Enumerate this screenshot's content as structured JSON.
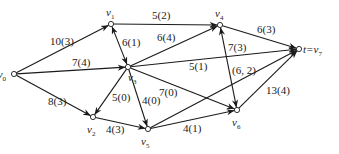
{
  "diagram": {
    "type": "flow-network",
    "nodes": [
      {
        "id": "v0",
        "label": "s=v",
        "sub": "0",
        "x": 14,
        "y": 74,
        "lx": -14,
        "ly": 78
      },
      {
        "id": "v1",
        "label": "v",
        "sub": "1",
        "x": 111,
        "y": 24,
        "lx": 106,
        "ly": 16
      },
      {
        "id": "v2",
        "label": "v",
        "sub": "2",
        "x": 93,
        "y": 117,
        "lx": 87,
        "ly": 133
      },
      {
        "id": "v3",
        "label": "v",
        "sub": "3",
        "x": 128,
        "y": 67,
        "lx": 128,
        "ly": 81
      },
      {
        "id": "v4",
        "label": "v",
        "sub": "4",
        "x": 220,
        "y": 25,
        "lx": 215,
        "ly": 17
      },
      {
        "id": "v5",
        "label": "v",
        "sub": "5",
        "x": 148,
        "y": 129,
        "lx": 141,
        "ly": 145
      },
      {
        "id": "v6",
        "label": "v",
        "sub": "6",
        "x": 237,
        "y": 110,
        "lx": 232,
        "ly": 126
      },
      {
        "id": "v7",
        "label": "t=v",
        "sub": "7",
        "x": 299,
        "y": 49,
        "lx": 303,
        "ly": 53
      }
    ],
    "edges": [
      {
        "from": "v0",
        "to": "v1",
        "label": "10(3)",
        "lx": 50,
        "ly": 45,
        "dir": "forward"
      },
      {
        "from": "v0",
        "to": "v3",
        "label": "7(4)",
        "lx": 72,
        "ly": 66,
        "dir": "forward"
      },
      {
        "from": "v0",
        "to": "v2",
        "label": "8(3)",
        "lx": 48,
        "ly": 105,
        "dir": "forward"
      },
      {
        "from": "v1",
        "to": "v4",
        "label": "5(2)",
        "lx": 152,
        "ly": 19,
        "dir": "forward"
      },
      {
        "from": "v1",
        "to": "v3",
        "label": "6(1)",
        "lx": 122,
        "ly": 46,
        "dir": "both"
      },
      {
        "from": "v3",
        "to": "v4",
        "label": "6(4)",
        "lx": 157,
        "ly": 41,
        "dir": "forward"
      },
      {
        "from": "v3",
        "to": "v7",
        "label": "5(1)",
        "lx": 189,
        "ly": 70,
        "dir": "forward"
      },
      {
        "from": "v3",
        "to": "v2",
        "label": "5(0)",
        "lx": 112,
        "ly": 101,
        "dir": "forward"
      },
      {
        "from": "v3",
        "to": "v5",
        "label": "4(0)",
        "lx": 142,
        "ly": 104,
        "dir": "forward"
      },
      {
        "from": "v3",
        "to": "v6",
        "label": "7(0)",
        "lx": 159,
        "ly": 96,
        "dir": "forward"
      },
      {
        "from": "v4",
        "to": "v7",
        "label": "6(3)",
        "lx": 257,
        "ly": 33,
        "dir": "forward"
      },
      {
        "from": "v6",
        "to": "v4",
        "label": "7(3)",
        "lx": 228,
        "ly": 51,
        "dir": "both"
      },
      {
        "from": "v5",
        "to": "v7",
        "label": "(6, 2)",
        "lx": 232,
        "ly": 74,
        "dir": "forward"
      },
      {
        "from": "v2",
        "to": "v5",
        "label": "4(3)",
        "lx": 106,
        "ly": 133,
        "dir": "forward"
      },
      {
        "from": "v5",
        "to": "v6",
        "label": "4(1)",
        "lx": 183,
        "ly": 132,
        "dir": "forward"
      },
      {
        "from": "v6",
        "to": "v7",
        "label": "13(4)",
        "lx": 266,
        "ly": 94,
        "dir": "forward"
      }
    ]
  },
  "colors": {
    "edge": "#1a1a1a",
    "node_fill": "#ffffff",
    "text": "#222222",
    "background": "#ffffff"
  }
}
